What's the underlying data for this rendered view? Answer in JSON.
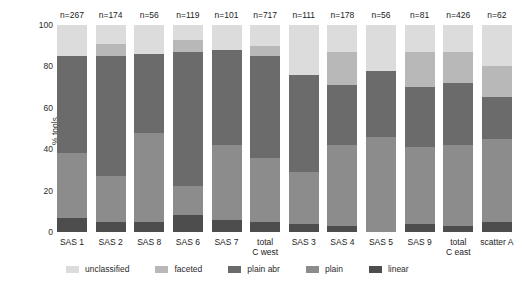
{
  "chart_data": {
    "type": "bar",
    "subtype": "stacked-percentage",
    "title": "",
    "xlabel": "",
    "ylabel": "% tools",
    "ylim": [
      0,
      100
    ],
    "yticks": [
      "0",
      "20",
      "40",
      "60",
      "80",
      "100"
    ],
    "grid": false,
    "legend_position": "bottom",
    "categories": [
      "SAS 1",
      "SAS 2",
      "SAS 8",
      "SAS 6",
      "SAS 7",
      "total\nC west",
      "SAS 3",
      "SAS 4",
      "SAS 5",
      "SAS 9",
      "total\nC east",
      "scatter A"
    ],
    "annotations": [
      "n=267",
      "n=174",
      "n=56",
      "n=119",
      "n=101",
      "n=717",
      "n=111",
      "n=178",
      "n=56",
      "n=81",
      "n=426",
      "n=62"
    ],
    "series": [
      {
        "name": "linear",
        "color": "#4d4d4d",
        "values": [
          7,
          5,
          5,
          8,
          6,
          5,
          4,
          3,
          0,
          4,
          3,
          5
        ]
      },
      {
        "name": "plain",
        "color": "#8c8c8c",
        "values": [
          31,
          22,
          43,
          14,
          36,
          31,
          25,
          39,
          46,
          37,
          39,
          40
        ]
      },
      {
        "name": "plain abr",
        "color": "#6b6b6b",
        "values": [
          47,
          58,
          38,
          65,
          46,
          49,
          47,
          29,
          32,
          29,
          30,
          20
        ]
      },
      {
        "name": "faceted",
        "color": "#b8b8b8",
        "values": [
          0,
          6,
          0,
          6,
          0,
          5,
          0,
          16,
          0,
          17,
          15,
          15
        ]
      },
      {
        "name": "unclassified",
        "color": "#dcdcdc",
        "values": [
          15,
          9,
          14,
          7,
          12,
          10,
          24,
          13,
          22,
          13,
          13,
          20
        ]
      }
    ],
    "legend": [
      {
        "label": "unclassified",
        "color": "#dcdcdc"
      },
      {
        "label": "faceted",
        "color": "#b8b8b8"
      },
      {
        "label": "plain abr",
        "color": "#6b6b6b"
      },
      {
        "label": "plain",
        "color": "#8c8c8c"
      },
      {
        "label": "linear",
        "color": "#4d4d4d"
      }
    ]
  }
}
